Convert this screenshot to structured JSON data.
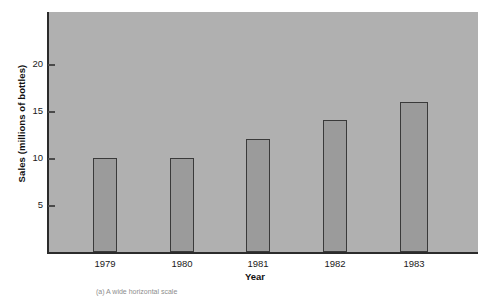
{
  "chart_data": {
    "type": "bar",
    "title": "",
    "subtitle": "",
    "xlabel": "Year",
    "ylabel": "Sales (millions of bottles)",
    "categories": [
      "1979",
      "1980",
      "1981",
      "1982",
      "1983"
    ],
    "values": [
      10,
      10,
      12,
      14,
      16
    ],
    "series": [
      {
        "name": "Sales",
        "values": [
          10,
          10,
          12,
          14,
          16
        ]
      }
    ],
    "ylim": [
      0,
      25
    ],
    "yticks": [
      5,
      10,
      15,
      20
    ],
    "ytick_labels": [
      "5",
      "10",
      "15",
      "20"
    ],
    "xtick_labels": [
      "1979",
      "1980",
      "1981",
      "1982",
      "1983"
    ],
    "grid": false,
    "legend": false,
    "legend_position": "none",
    "bar_color": "#9b9b9b",
    "bar_edge_color": "#3a3a3a",
    "panel_color": "#b0b0b0",
    "axis_color": "#2b2b2b",
    "text_color": "#1a1a1a"
  },
  "figure": {
    "caption": "(a)  A wide horizontal scale"
  },
  "axes": {
    "y_title": "Sales (millions of bottles)",
    "x_title": "Year",
    "y_ticks": [
      {
        "label": "20",
        "value": 20
      },
      {
        "label": "15",
        "value": 15
      },
      {
        "label": "10",
        "value": 10
      },
      {
        "label": "5",
        "value": 5
      }
    ],
    "x_ticks": [
      {
        "label": "1979"
      },
      {
        "label": "1980"
      },
      {
        "label": "1981"
      },
      {
        "label": "1982"
      },
      {
        "label": "1983"
      }
    ]
  },
  "bars": [
    {
      "category": "1979",
      "value": 10
    },
    {
      "category": "1980",
      "value": 10
    },
    {
      "category": "1981",
      "value": 12
    },
    {
      "category": "1982",
      "value": 14
    },
    {
      "category": "1983",
      "value": 16
    }
  ]
}
